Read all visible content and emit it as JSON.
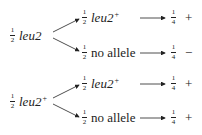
{
  "diagram": {
    "groups": [
      {
        "source": {
          "fraction_num": "1",
          "fraction_den": "2",
          "genotype": "leu2",
          "superscript": ""
        },
        "branches": [
          {
            "fraction_num": "1",
            "fraction_den": "2",
            "allele": "leu2",
            "superscript": "+",
            "italic": true,
            "result_num": "1",
            "result_den": "4",
            "phenotype": "+"
          },
          {
            "fraction_num": "1",
            "fraction_den": "2",
            "allele": "no allele",
            "superscript": "",
            "italic": false,
            "result_num": "1",
            "result_den": "4",
            "phenotype": "−"
          }
        ]
      },
      {
        "source": {
          "fraction_num": "1",
          "fraction_den": "2",
          "genotype": "leu2",
          "superscript": "+"
        },
        "branches": [
          {
            "fraction_num": "1",
            "fraction_den": "2",
            "allele": "leu2",
            "superscript": "+",
            "italic": true,
            "result_num": "1",
            "result_den": "4",
            "phenotype": "+"
          },
          {
            "fraction_num": "1",
            "fraction_den": "2",
            "allele": "no allele",
            "superscript": "",
            "italic": false,
            "result_num": "1",
            "result_den": "4",
            "phenotype": "+"
          }
        ]
      }
    ]
  }
}
